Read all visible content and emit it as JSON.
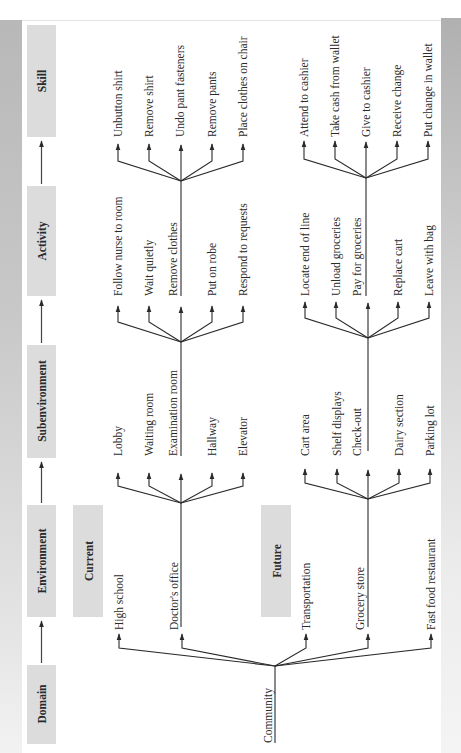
{
  "header_flow": [
    {
      "label": "Skill"
    },
    {
      "label": "Activity"
    },
    {
      "label": "Subenvironment"
    },
    {
      "label": "Environment"
    },
    {
      "label": "Domain"
    }
  ],
  "groups": {
    "current": "Current",
    "future": "Future"
  },
  "domain": {
    "label": "Community"
  },
  "environments": [
    {
      "label": "High school"
    },
    {
      "label": "Doctor's office"
    },
    {
      "label": "Transportation"
    },
    {
      "label": "Grocery store"
    },
    {
      "label": "Fast food restaurant"
    }
  ],
  "subenvironments": {
    "doctors_office": [
      {
        "label": "Lobby"
      },
      {
        "label": "Waiting room"
      },
      {
        "label": "Examination room"
      },
      {
        "label": "Hallway"
      },
      {
        "label": "Elevator"
      }
    ],
    "grocery_store": [
      {
        "label": "Cart area"
      },
      {
        "label": "Shelf displays"
      },
      {
        "label": "Check-out"
      },
      {
        "label": "Dairy section"
      },
      {
        "label": "Parking lot"
      }
    ]
  },
  "activities": {
    "examination_room": [
      {
        "label": "Follow nurse to room"
      },
      {
        "label": "Wait quietly"
      },
      {
        "label": "Remove clothes"
      },
      {
        "label": "Put on robe"
      },
      {
        "label": "Respond to requests"
      }
    ],
    "check_out": [
      {
        "label": "Locate end of line"
      },
      {
        "label": "Unload groceries"
      },
      {
        "label": "Pay for groceries"
      },
      {
        "label": "Replace cart"
      },
      {
        "label": "Leave with bag"
      }
    ]
  },
  "skills": {
    "remove_clothes": [
      {
        "label": "Unbutton shirt"
      },
      {
        "label": "Remove shirt"
      },
      {
        "label": "Undo pant fasteners"
      },
      {
        "label": "Remove pants"
      },
      {
        "label": "Place clothes on chair"
      }
    ],
    "pay_for_groceries": [
      {
        "label": "Attend to cashier"
      },
      {
        "label": "Take cash from wallet"
      },
      {
        "label": "Give to cashier"
      },
      {
        "label": "Receive change"
      },
      {
        "label": "Put change in wallet"
      }
    ]
  },
  "colors": {
    "box_fill": "#dcdcdc",
    "line": "#2a2a2a",
    "band": "#c4c4c4"
  }
}
